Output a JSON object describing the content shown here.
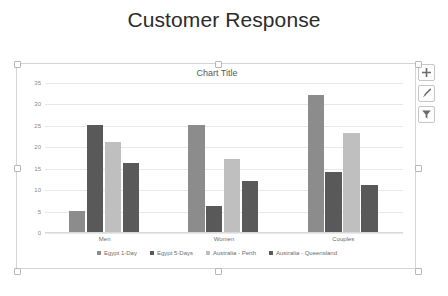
{
  "page": {
    "heading": "Customer Response"
  },
  "chart_object": {
    "buttons": [
      {
        "name": "chart-elements-button",
        "icon": "plus-icon",
        "label": "+"
      },
      {
        "name": "chart-styles-button",
        "icon": "brush-icon",
        "label": "Chart Styles"
      },
      {
        "name": "chart-filters-button",
        "icon": "funnel-icon",
        "label": "Chart Filters"
      }
    ]
  },
  "chart_data": {
    "type": "bar",
    "title": "Chart Title",
    "xlabel": "",
    "ylabel": "",
    "ylim": [
      0,
      35
    ],
    "yticks": [
      0,
      5,
      10,
      15,
      20,
      25,
      30,
      35
    ],
    "grid": true,
    "legend_position": "bottom",
    "categories": [
      "Men",
      "Women",
      "Couples"
    ],
    "series": [
      {
        "name": "Egypt 1-Day",
        "color": "#8c8c8c",
        "values": [
          5,
          25,
          32
        ]
      },
      {
        "name": "Egypt 5-Days",
        "color": "#595959",
        "values": [
          25,
          6,
          14
        ]
      },
      {
        "name": "Australia - Perth",
        "color": "#bfbfbf",
        "values": [
          21,
          17,
          23
        ]
      },
      {
        "name": "Australia - Queensland",
        "color": "#595959",
        "values": [
          16,
          12,
          11
        ]
      }
    ]
  }
}
